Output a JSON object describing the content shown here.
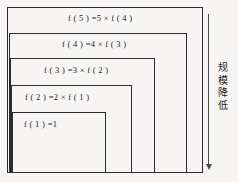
{
  "diagram": {
    "background_color": "#f6f5f3",
    "line_color": "#2b2b2b",
    "boxes": [
      {
        "id": "level-5",
        "label": "f ( 5 ) =5 × f ( 4 )",
        "level": 5
      },
      {
        "id": "level-4",
        "label": "f ( 4 ) =4 × f ( 3 )",
        "level": 4
      },
      {
        "id": "level-3",
        "label": "f ( 3 ) =3 × f ( 2 )",
        "level": 3
      },
      {
        "id": "level-2",
        "label": "f ( 2 ) =2 × f ( 1 )",
        "level": 2
      },
      {
        "id": "level-1",
        "label": "f ( 1 ) =1",
        "level": 1
      }
    ],
    "annotation": {
      "text": "规模降低",
      "chars": [
        "规",
        "模",
        "降",
        "低"
      ],
      "direction": "downward",
      "arrow_color": "#4a4a4a"
    }
  }
}
